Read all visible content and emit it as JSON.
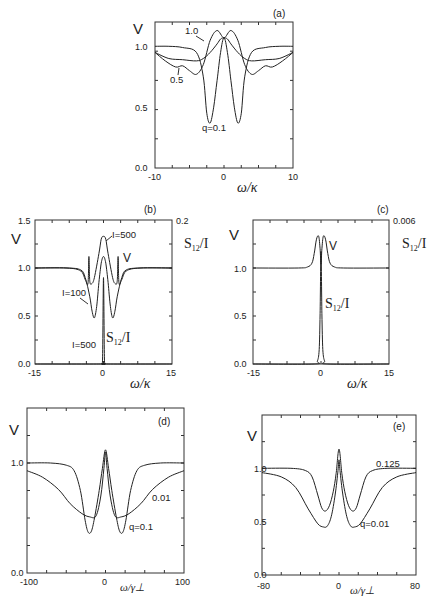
{
  "figure": {
    "panels": [
      "(a)",
      "(b)",
      "(c)",
      "(d)",
      "(e)"
    ]
  },
  "chart_data": [
    {
      "id": "a",
      "type": "line",
      "panel_label": "(a)",
      "title": "",
      "xlabel": "ω/κ",
      "ylabel": "V",
      "xlim": [
        -10,
        10
      ],
      "ylim": [
        0.0,
        1.2
      ],
      "xticks": [
        "-10",
        "0",
        "10"
      ],
      "yticks": [
        "0.0",
        "0.5",
        "1.0"
      ],
      "series": [
        {
          "name": "q=0.1",
          "x": [
            -10,
            -8,
            -6,
            -4,
            -3,
            -2.5,
            -2,
            -1.5,
            -1,
            -0.5,
            0,
            0.5,
            1,
            1.5,
            2,
            2.5,
            3,
            4,
            6,
            8,
            10
          ],
          "values": [
            1.0,
            1.0,
            0.99,
            0.95,
            0.75,
            0.45,
            0.37,
            0.5,
            0.72,
            0.95,
            1.07,
            0.95,
            0.72,
            0.5,
            0.37,
            0.45,
            0.75,
            0.95,
            0.99,
            1.0,
            1.0
          ]
        },
        {
          "name": "0.5",
          "x": [
            -10,
            -8,
            -6,
            -4,
            -3,
            -2,
            -1,
            -0.5,
            0,
            0.5,
            1,
            2,
            3,
            4,
            6,
            8,
            10
          ],
          "values": [
            0.95,
            0.9,
            0.89,
            0.88,
            0.9,
            0.95,
            1.02,
            1.06,
            1.07,
            1.06,
            1.02,
            0.95,
            0.9,
            0.88,
            0.89,
            0.9,
            0.95
          ]
        },
        {
          "name": "1.0",
          "x": [
            -10,
            -8.5,
            -7,
            -6,
            -5,
            -4,
            -3,
            -2,
            -1,
            0,
            1,
            2,
            3,
            4,
            5,
            6,
            7,
            8.5,
            10
          ],
          "values": [
            0.95,
            0.88,
            0.83,
            0.84,
            0.8,
            0.77,
            0.85,
            1.05,
            1.13,
            1.07,
            1.13,
            1.05,
            0.85,
            0.77,
            0.8,
            0.84,
            0.83,
            0.88,
            0.95
          ]
        }
      ],
      "annotations": [
        "1.0",
        "0.5",
        "q=0.1"
      ]
    },
    {
      "id": "b",
      "type": "line",
      "panel_label": "(b)",
      "xlabel": "ω/κ",
      "ylabel": "V",
      "ylabel_right": "S12/I",
      "xlim": [
        -15,
        15
      ],
      "ylim": [
        0.0,
        1.5
      ],
      "ylim_right": [
        0.0,
        0.2
      ],
      "xticks": [
        "-15",
        "0",
        "15"
      ],
      "yticks": [
        "0.0",
        "0.5",
        "1.0",
        "1.5"
      ],
      "yticks_right": [
        "0.2"
      ],
      "series": [
        {
          "name": "I=100",
          "x": [
            -15,
            -8,
            -5,
            -4,
            -3,
            -2.5,
            -2,
            -1.5,
            -1,
            -0.5,
            0,
            0.5,
            1,
            1.5,
            2,
            2.5,
            3,
            4,
            5,
            8,
            15
          ],
          "values": [
            1.0,
            1.0,
            0.98,
            0.9,
            0.7,
            0.55,
            0.48,
            0.6,
            0.85,
            1.05,
            1.12,
            1.05,
            0.85,
            0.6,
            0.48,
            0.55,
            0.7,
            0.9,
            0.98,
            1.0,
            1.0
          ]
        },
        {
          "name": "I=500",
          "x": [
            -15,
            -8,
            -5,
            -4,
            -3.4,
            -3.2,
            -3,
            -2.5,
            -2,
            -1,
            -0.5,
            0,
            0.5,
            1,
            2,
            2.5,
            3,
            3.2,
            3.4,
            4,
            5,
            8,
            15
          ],
          "values": [
            1.0,
            1.0,
            0.97,
            0.88,
            0.84,
            1.12,
            0.86,
            0.84,
            0.9,
            1.15,
            1.3,
            1.33,
            1.3,
            1.15,
            0.9,
            0.84,
            0.86,
            1.12,
            0.84,
            0.88,
            0.97,
            1.0,
            1.0
          ]
        },
        {
          "name": "S12/I (I=500)",
          "x": [
            -15,
            -1,
            -0.4,
            -0.2,
            0,
            0.2,
            0.4,
            1,
            15
          ],
          "values": [
            0.0,
            0.0,
            0.005,
            0.05,
            0.6,
            0.05,
            0.005,
            0.0,
            0.0
          ]
        }
      ],
      "annotations": [
        "I=500",
        "V",
        "I=100",
        "I=500",
        "S12/I"
      ]
    },
    {
      "id": "c",
      "type": "line",
      "panel_label": "(c)",
      "xlabel": "ω/κ",
      "ylabel": "V",
      "ylabel_right": "S12/I",
      "xlim": [
        -15,
        15
      ],
      "ylim": [
        0.0,
        1.5
      ],
      "ylim_right": [
        0.0,
        0.006
      ],
      "xticks": [
        "-15",
        "0",
        "15"
      ],
      "yticks": [
        "0.0",
        "0.5",
        "1.0"
      ],
      "yticks_right": [
        "0.006"
      ],
      "series": [
        {
          "name": "V",
          "x": [
            -15,
            -5,
            -3,
            -2,
            -1.5,
            -1,
            -0.5,
            -0.2,
            0,
            0.2,
            0.5,
            1,
            1.5,
            2,
            3,
            5,
            15
          ],
          "values": [
            1.0,
            1.0,
            1.01,
            1.05,
            1.15,
            1.3,
            1.33,
            1.2,
            1.04,
            1.2,
            1.33,
            1.3,
            1.15,
            1.05,
            1.01,
            1.0,
            1.0
          ]
        },
        {
          "name": "S12/I",
          "x": [
            -15,
            -1.5,
            -0.8,
            -0.4,
            -0.2,
            0,
            0.2,
            0.4,
            0.8,
            1.5,
            15
          ],
          "values": [
            0.0,
            0.0,
            0.02,
            0.1,
            0.35,
            0.78,
            0.35,
            0.1,
            0.02,
            0.0,
            0.0
          ]
        }
      ],
      "annotations": [
        "V",
        "S12/I"
      ]
    },
    {
      "id": "d",
      "type": "line",
      "panel_label": "(d)",
      "xlabel": "ω/γ⊥",
      "ylabel": "V",
      "xlim": [
        -100,
        100
      ],
      "ylim": [
        0.0,
        1.5
      ],
      "xticks": [
        "-100",
        "0",
        "100"
      ],
      "yticks": [
        "0.0",
        "1.0"
      ],
      "series": [
        {
          "name": "q=0.1",
          "x": [
            -100,
            -70,
            -50,
            -40,
            -32,
            -26,
            -22,
            -18,
            -14,
            -8,
            -4,
            0,
            4,
            8,
            14,
            18,
            22,
            26,
            32,
            40,
            50,
            70,
            100
          ],
          "values": [
            1.0,
            1.0,
            0.98,
            0.93,
            0.75,
            0.48,
            0.37,
            0.38,
            0.5,
            0.75,
            0.95,
            1.12,
            0.95,
            0.75,
            0.5,
            0.38,
            0.37,
            0.48,
            0.75,
            0.93,
            0.98,
            1.0,
            1.0
          ]
        },
        {
          "name": "0.01",
          "x": [
            -100,
            -80,
            -60,
            -45,
            -30,
            -20,
            -12,
            -6,
            -2,
            0,
            2,
            6,
            12,
            20,
            30,
            45,
            60,
            80,
            100
          ],
          "values": [
            0.93,
            0.87,
            0.76,
            0.63,
            0.54,
            0.51,
            0.52,
            0.7,
            0.95,
            1.1,
            0.95,
            0.7,
            0.52,
            0.51,
            0.54,
            0.63,
            0.76,
            0.87,
            0.93
          ]
        }
      ],
      "annotations": [
        "0.01",
        "q=0.1"
      ]
    },
    {
      "id": "e",
      "type": "line",
      "panel_label": "(e)",
      "xlabel": "ω/γ⊥",
      "ylabel": "V",
      "xlim": [
        -80,
        80
      ],
      "ylim": [
        0.0,
        1.5
      ],
      "xticks": [
        "-80",
        "0",
        "80"
      ],
      "yticks": [
        "0.0",
        "0.5",
        "1.0"
      ],
      "series": [
        {
          "name": "0.125",
          "x": [
            -80,
            -50,
            -35,
            -28,
            -22,
            -18,
            -14,
            -10,
            -6,
            -3,
            0,
            3,
            6,
            10,
            14,
            18,
            22,
            28,
            35,
            50,
            80
          ],
          "values": [
            1.0,
            1.0,
            0.98,
            0.92,
            0.75,
            0.63,
            0.6,
            0.65,
            0.78,
            0.95,
            1.18,
            0.95,
            0.78,
            0.65,
            0.6,
            0.63,
            0.75,
            0.92,
            0.98,
            1.0,
            1.0
          ]
        },
        {
          "name": "q=0.01",
          "x": [
            -80,
            -60,
            -45,
            -32,
            -22,
            -16,
            -12,
            -8,
            -4,
            -1,
            0,
            1,
            4,
            8,
            12,
            16,
            22,
            32,
            45,
            60,
            80
          ],
          "values": [
            0.96,
            0.92,
            0.82,
            0.62,
            0.48,
            0.45,
            0.46,
            0.55,
            0.75,
            0.98,
            1.08,
            0.98,
            0.75,
            0.55,
            0.46,
            0.45,
            0.48,
            0.62,
            0.82,
            0.92,
            0.96
          ]
        }
      ],
      "annotations": [
        "0.125",
        "q=0.01"
      ]
    }
  ]
}
